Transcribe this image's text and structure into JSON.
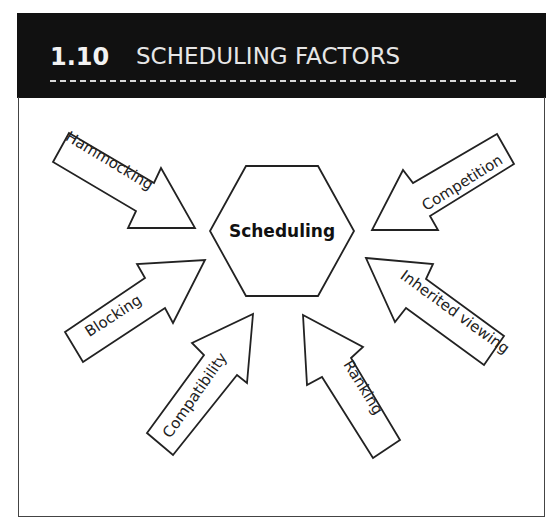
{
  "header": {
    "section_number": "1.10",
    "title": "SCHEDULING FACTORS"
  },
  "diagram": {
    "center": "Scheduling",
    "factors": [
      {
        "label": "Hammocking",
        "position": "top-left"
      },
      {
        "label": "Competition",
        "position": "top-right"
      },
      {
        "label": "Blocking",
        "position": "middle-left"
      },
      {
        "label": "Inherited viewing",
        "position": "middle-right"
      },
      {
        "label": "Compatibility",
        "position": "bottom-left"
      },
      {
        "label": "Ranking",
        "position": "bottom-right"
      }
    ]
  },
  "colors": {
    "header_bg": "#111111",
    "header_text": "#e6e6e6",
    "stroke": "#222222"
  }
}
